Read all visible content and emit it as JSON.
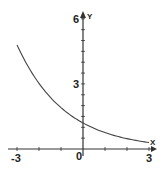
{
  "chart_data": {
    "type": "line",
    "title": "",
    "xlabel": "X",
    "ylabel": "Y",
    "xlim": [
      -3,
      3
    ],
    "ylim": [
      0,
      6
    ],
    "x_ticks": [
      "-3",
      "0",
      "3"
    ],
    "y_ticks": [
      "3",
      "6"
    ],
    "grid": false,
    "function": "exponential decay, approx y = 1.2 * 0.63^x",
    "series": [
      {
        "name": "curve",
        "x": [
          -3,
          -2,
          -1,
          0,
          1,
          2,
          3
        ],
        "y": [
          4.8,
          3.0,
          1.9,
          1.2,
          0.76,
          0.48,
          0.3
        ]
      }
    ]
  },
  "labels": {
    "x_axis": "X",
    "y_axis": "Y",
    "x_neg": "-3",
    "x_zero": "0",
    "x_pos": "3",
    "y_mid": "3",
    "y_top": "6"
  },
  "colors": {
    "axis": "#333333",
    "curve": "#444444",
    "text": "#222222"
  }
}
